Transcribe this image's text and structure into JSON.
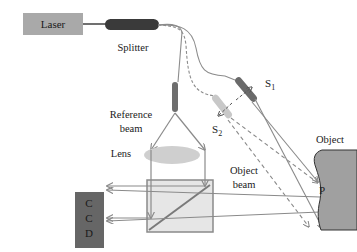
{
  "labels": {
    "laser": "Laser",
    "splitter": "Splitter",
    "s1": "S",
    "s1_sub": "1",
    "s2": "S",
    "s2_sub": "2",
    "reference_beam_line1": "Reference",
    "reference_beam_line2": "beam",
    "lens": "Lens",
    "object_beam_line1": "Object",
    "object_beam_line2": "beam",
    "object": "Object",
    "point_p": "P",
    "ccd_c1": "C",
    "ccd_c2": "C",
    "ccd_d": "D"
  },
  "colors": {
    "laser_box": "#a9a9a9",
    "splitter": "#3a3a3a",
    "fiber": "#8c8c8c",
    "ref_probe": "#6e6e6e",
    "s1_probe": "#6a6a6a",
    "s2_probe": "#c8c8c8",
    "lens": "#cfcfcf",
    "beam": "#8a8a8a",
    "cube_fill": "#e6e6e6",
    "ccd": "#666666",
    "object_fill": "#a0a0a0"
  }
}
